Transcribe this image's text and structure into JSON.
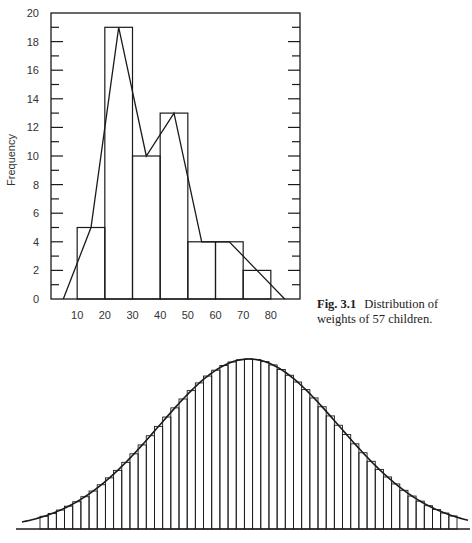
{
  "caption": {
    "label": "Fig. 3.1",
    "text_line1": "Distribution of",
    "text_line2": "weights of 57 children."
  },
  "chart_data": [
    {
      "type": "bar",
      "subtype": "histogram-with-frequency-polygon",
      "title": "Fig. 3.1 Distribution of weights of 57 children.",
      "xlabel": "",
      "ylabel": "Frequency",
      "bin_edges": [
        10,
        20,
        30,
        40,
        50,
        60,
        70,
        80
      ],
      "categories": [
        "10-20",
        "20-30",
        "30-40",
        "40-50",
        "50-60",
        "60-70",
        "70-80"
      ],
      "values": [
        5,
        19,
        10,
        13,
        4,
        4,
        2
      ],
      "frequency_polygon": {
        "x": [
          5,
          15,
          25,
          35,
          45,
          55,
          65,
          75,
          85
        ],
        "y": [
          0,
          5,
          19,
          10,
          13,
          4,
          4,
          2,
          0
        ]
      },
      "xticks": [
        10,
        20,
        30,
        40,
        50,
        60,
        70,
        80
      ],
      "yticks": [
        0,
        2,
        4,
        6,
        8,
        10,
        12,
        14,
        16,
        18,
        20
      ],
      "xlim": [
        0,
        90
      ],
      "ylim": [
        0,
        20
      ],
      "grid": false,
      "legend": null
    },
    {
      "type": "bar",
      "subtype": "histogram-with-normal-curve",
      "title": "",
      "xlabel": "",
      "ylabel": "",
      "n_bins": 51,
      "distribution": "normal",
      "description": "Narrow-bin histogram closely approximating a smooth bell-shaped (normal) curve",
      "xticks": [],
      "yticks": [],
      "grid": false,
      "legend": null
    }
  ]
}
